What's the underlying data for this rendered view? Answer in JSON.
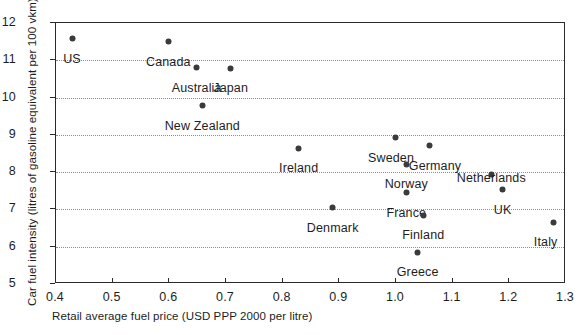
{
  "chart_data": {
    "type": "scatter",
    "title": "",
    "xlabel": "Retail average fuel price (USD PPP 2000 per litre)",
    "ylabel": "Car fuel intensity (litres of gasoline equivalent per 100 vkm)",
    "xlim": [
      0.4,
      1.3
    ],
    "ylim": [
      5,
      12
    ],
    "xticks": [
      "0.4",
      "0.5",
      "0.6",
      "0.7",
      "0.8",
      "0.9",
      "1.0",
      "1.1",
      "1.2",
      "1.3"
    ],
    "xtick_values": [
      0.4,
      0.5,
      0.6,
      0.7,
      0.8,
      0.9,
      1.0,
      1.1,
      1.2,
      1.3
    ],
    "yticks": [
      "5",
      "6",
      "7",
      "8",
      "9",
      "10",
      "11",
      "12"
    ],
    "ytick_values": [
      5,
      6,
      7,
      8,
      9,
      10,
      11,
      12
    ],
    "grid": "horizontal-dotted",
    "legend": "none",
    "marker_color": "#3b3b3b",
    "axis_color": "#2a2a2a",
    "grid_color": "#8d8d8d",
    "points": [
      {
        "label": "US",
        "x": 0.43,
        "y": 11.55,
        "label_dx": 0,
        "label_dy": 13
      },
      {
        "label": "Canada",
        "x": 0.6,
        "y": 11.47,
        "label_dx": 0,
        "label_dy": 13
      },
      {
        "label": "Australia",
        "x": 0.65,
        "y": 10.77,
        "label_dx": 0,
        "label_dy": 13
      },
      {
        "label": "Japan",
        "x": 0.71,
        "y": 10.76,
        "label_dx": 0,
        "label_dy": 13
      },
      {
        "label": "New Zealand",
        "x": 0.66,
        "y": 9.75,
        "label_dx": 0,
        "label_dy": 13
      },
      {
        "label": "Ireland",
        "x": 0.83,
        "y": 8.62,
        "label_dx": 0,
        "label_dy": 13
      },
      {
        "label": "Sweden",
        "x": 1.0,
        "y": 8.9,
        "label_dx": -4,
        "label_dy": 13
      },
      {
        "label": "Germany",
        "x": 1.06,
        "y": 8.68,
        "label_dx": 6,
        "label_dy": 13
      },
      {
        "label": "Norway",
        "x": 1.02,
        "y": 8.18,
        "label_dx": 0,
        "label_dy": 13
      },
      {
        "label": "Netherlands",
        "x": 1.17,
        "y": 7.9,
        "label_dx": 0,
        "label_dy": -4
      },
      {
        "label": "France",
        "x": 1.02,
        "y": 7.42,
        "label_dx": 0,
        "label_dy": 13
      },
      {
        "label": "UK",
        "x": 1.19,
        "y": 7.5,
        "label_dx": 0,
        "label_dy": 13
      },
      {
        "label": "Denmark",
        "x": 0.89,
        "y": 7.02,
        "label_dx": 0,
        "label_dy": 13
      },
      {
        "label": "Finland",
        "x": 1.05,
        "y": 6.82,
        "label_dx": 0,
        "label_dy": 13
      },
      {
        "label": "Italy",
        "x": 1.28,
        "y": 6.63,
        "label_dx": -8,
        "label_dy": 13
      },
      {
        "label": "Greece",
        "x": 1.04,
        "y": 5.83,
        "label_dx": 0,
        "label_dy": 13
      }
    ]
  }
}
